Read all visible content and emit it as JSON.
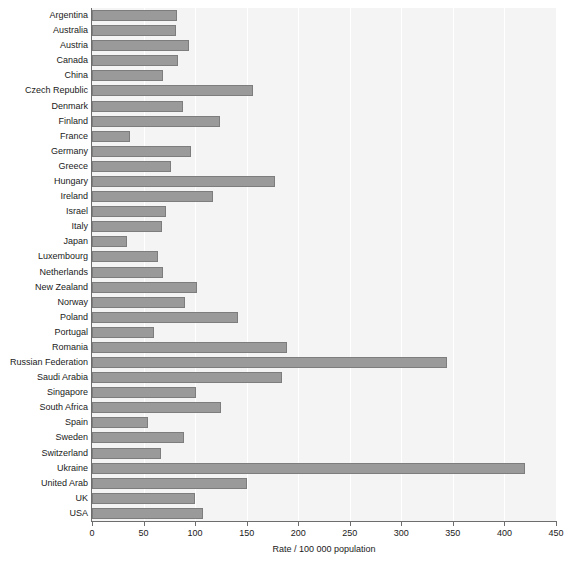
{
  "chart_data": {
    "type": "bar",
    "orientation": "horizontal",
    "title": "",
    "xlabel": "Rate / 100 000 population",
    "ylabel": "",
    "xlim": [
      0,
      450
    ],
    "xticks": [
      0,
      50,
      100,
      150,
      200,
      250,
      300,
      350,
      400,
      450
    ],
    "grid": true,
    "legend": false,
    "bar_color": "#9a9a9a",
    "bar_border_color": "#7d7d7d",
    "plot_bg": "#f4f4f4",
    "page_bg": "#ffffff",
    "axis_color": "#6d6d6d",
    "categories": [
      "Argentina",
      "Australia",
      "Austria",
      "Canada",
      "China",
      "Czech Republic",
      "Denmark",
      "Finland",
      "France",
      "Germany",
      "Greece",
      "Hungary",
      "Ireland",
      "Israel",
      "Italy",
      "Japan",
      "Luxembourg",
      "Netherlands",
      "New Zealand",
      "Norway",
      "Poland",
      "Portugal",
      "Romania",
      "Russian Federation",
      "Saudi Arabia",
      "Singapore",
      "South Africa",
      "Spain",
      "Sweden",
      "Switzerland",
      "Ukraine",
      "United Arab",
      "UK",
      "USA"
    ],
    "values": [
      82,
      81,
      94,
      83,
      69,
      156,
      88,
      124,
      37,
      96,
      77,
      177,
      117,
      72,
      68,
      34,
      64,
      69,
      102,
      90,
      142,
      60,
      189,
      344,
      184,
      101,
      125,
      54,
      89,
      67,
      420,
      150,
      100,
      108
    ]
  }
}
